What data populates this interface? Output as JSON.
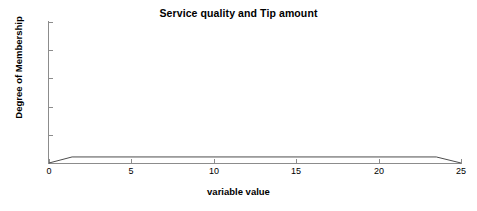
{
  "chart_data": {
    "type": "line",
    "title": "Service quality and Tip amount",
    "xlabel": "variable value",
    "ylabel": "Degree of Membership",
    "xlim": [
      0,
      25
    ],
    "ylim": [
      0.0,
      1.0
    ],
    "xticks": [
      0,
      5,
      10,
      15,
      20,
      25
    ],
    "xtick_labels": [
      "0",
      "5",
      "10",
      "15",
      "20",
      "25"
    ],
    "yticks": [
      0.0,
      0.2,
      0.4,
      0.6,
      0.8,
      1.0
    ],
    "ytick_labels": [
      "0.0",
      "0.2",
      "0.4",
      "0.6",
      "0.8",
      "1.0"
    ],
    "grid": false,
    "legend": false,
    "line_color": "#4d4d4d",
    "series": [
      {
        "name": "membership",
        "x": [
          0,
          1.4,
          23.5,
          25
        ],
        "values": [
          0.0,
          0.043,
          0.043,
          0.0
        ]
      }
    ]
  },
  "figure": {
    "background_color": "#ffffff",
    "axis_color": "#8c8c8c",
    "text_color": "#000000"
  }
}
